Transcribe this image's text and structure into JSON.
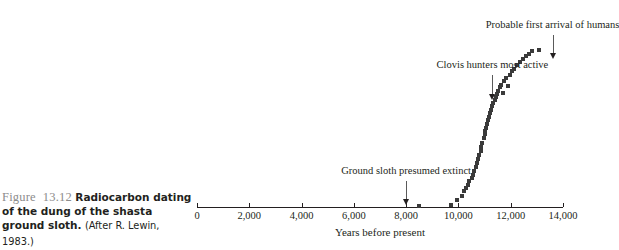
{
  "caption": {
    "figure_number": "Figure 13.12",
    "bold_text": "Radiocarbon dating of the dung of the shasta ground sloth.",
    "source": "(After R. Lewin, 1983.)"
  },
  "chart_data": {
    "type": "scatter",
    "title": "Radiocarbon dating of the dung of the shasta ground sloth",
    "xlabel": "Years before present",
    "ylabel": "",
    "xlim": [
      0,
      14000
    ],
    "ylim": [
      0,
      1
    ],
    "grid": false,
    "legend": "none",
    "xticks": [
      0,
      2000,
      4000,
      6000,
      8000,
      10000,
      12000,
      14000
    ],
    "xticklabels": [
      "0",
      "2,000",
      "4,000",
      "6,000",
      "8,000",
      "10,000",
      "12,000",
      "14,000"
    ],
    "x": [
      8500,
      9700,
      9950,
      10150,
      10200,
      10300,
      10350,
      10420,
      10500,
      10560,
      10600,
      10660,
      10720,
      10760,
      10800,
      10850,
      10880,
      10920,
      10960,
      11000,
      11020,
      11060,
      11100,
      11140,
      11160,
      11200,
      11240,
      11280,
      11330,
      11380,
      11420,
      11470,
      11520,
      11580,
      11640,
      11700,
      11760,
      11830,
      11900,
      11980,
      12060,
      12140,
      12240,
      12350,
      12460,
      12580,
      12700,
      12820,
      13080
    ],
    "y": [
      0.005,
      0.01,
      0.035,
      0.06,
      0.09,
      0.105,
      0.125,
      0.145,
      0.165,
      0.18,
      0.205,
      0.23,
      0.25,
      0.275,
      0.3,
      0.32,
      0.345,
      0.37,
      0.395,
      0.42,
      0.44,
      0.455,
      0.48,
      0.5,
      0.52,
      0.54,
      0.56,
      0.58,
      0.6,
      0.615,
      0.635,
      0.655,
      0.67,
      0.69,
      0.705,
      0.66,
      0.725,
      0.745,
      0.7,
      0.765,
      0.785,
      0.8,
      0.82,
      0.835,
      0.855,
      0.87,
      0.885,
      0.9,
      0.905
    ],
    "annotations": [
      {
        "name": "ground-sloth-extinct",
        "label": "Ground sloth presumed extinct",
        "x": 8000,
        "text_y": 0.175,
        "arrow_from_y": 0.145,
        "arrow_to_y": 0.01
      },
      {
        "name": "clovis-hunters",
        "label": "Clovis hunters most active",
        "x": 11300,
        "text_y": 0.79,
        "arrow_from_y": 0.76,
        "arrow_to_y": 0.62
      },
      {
        "name": "first-arrival-humans",
        "label": "Probable first arrival of humans",
        "x": 13600,
        "text_y": 1.025,
        "arrow_from_y": 0.995,
        "arrow_to_y": 0.855
      }
    ]
  }
}
